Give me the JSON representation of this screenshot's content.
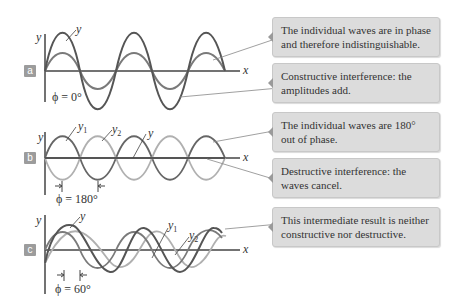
{
  "panels": [
    {
      "id": "a",
      "label": "a",
      "phase": "ϕ = 0°",
      "axis_y": "y",
      "axis_x": "x",
      "curve_labels": {
        "y": "y"
      },
      "notes": [
        "The individual waves are in phase and therefore indistinguishable.",
        "Constructive interference: the amplitudes add."
      ]
    },
    {
      "id": "b",
      "label": "b",
      "phase": "ϕ = 180°",
      "axis_y": "y",
      "axis_x": "x",
      "curve_labels": {
        "y1": "y",
        "y1_sub": "1",
        "y2": "y",
        "y2_sub": "2",
        "y": "y"
      },
      "notes": [
        "The individual waves are 180° out of phase.",
        "Destructive interference: the waves cancel."
      ]
    },
    {
      "id": "c",
      "label": "c",
      "phase": "ϕ = 60°",
      "axis_y": "y",
      "axis_x": "x",
      "curve_labels": {
        "y": "y",
        "y1": "y",
        "y1_sub": "1",
        "y2": "y",
        "y2_sub": "2"
      },
      "notes": [
        "This intermediate result is neither constructive nor destructive."
      ]
    }
  ],
  "colors": {
    "dark_wave": "#555555",
    "light_wave": "#aaaaaa",
    "medium_wave": "#7a7a7a",
    "box_bg": "#dcdcdc",
    "label_bg": "#9c9c9c"
  }
}
